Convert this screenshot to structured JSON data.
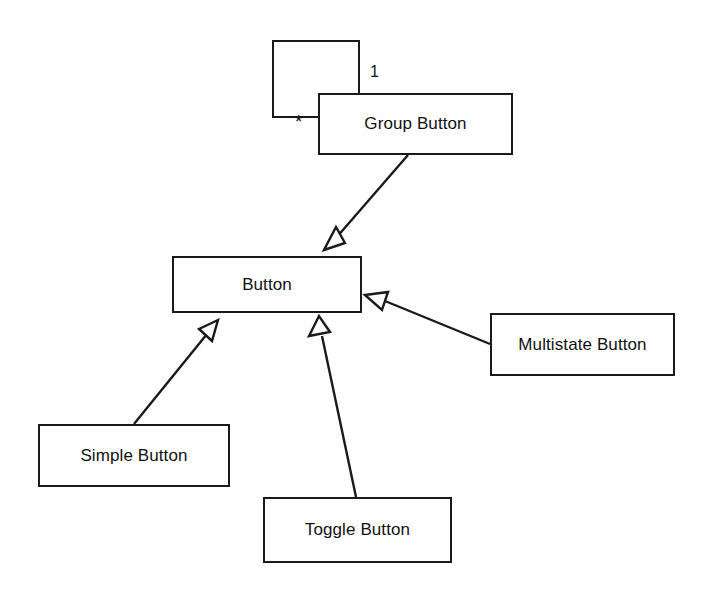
{
  "diagram": {
    "type": "uml-class-diagram",
    "background_color": "#ffffff",
    "stroke_color": "#1a1a1a",
    "text_color": "#121212",
    "classes": [
      {
        "id": "unnamed",
        "label": "",
        "x": 272,
        "y": 40,
        "w": 88,
        "h": 78
      },
      {
        "id": "group",
        "label": "Group Button",
        "x": 318,
        "y": 93,
        "w": 195,
        "h": 62
      },
      {
        "id": "button",
        "label": "Button",
        "x": 172,
        "y": 256,
        "w": 190,
        "h": 57
      },
      {
        "id": "simple",
        "label": "Simple Button",
        "x": 38,
        "y": 424,
        "w": 192,
        "h": 63
      },
      {
        "id": "toggle",
        "label": "Toggle Button",
        "x": 263,
        "y": 497,
        "w": 189,
        "h": 66
      },
      {
        "id": "multistate",
        "label": "Multistate Button",
        "x": 490,
        "y": 313,
        "w": 185,
        "h": 63
      }
    ],
    "multiplicities": [
      {
        "id": "one",
        "label": "1",
        "x": 370,
        "y": 64
      },
      {
        "id": "many",
        "label": "*",
        "x": 295,
        "y": 112
      }
    ],
    "generalizations": [
      {
        "id": "group-to-button",
        "from": "group",
        "to": "button",
        "arrow": "hollow-triangle"
      },
      {
        "id": "simple-to-button",
        "from": "simple",
        "to": "button",
        "arrow": "hollow-triangle"
      },
      {
        "id": "toggle-to-button",
        "from": "toggle",
        "to": "button",
        "arrow": "hollow-triangle"
      },
      {
        "id": "multistate-to-button",
        "from": "multistate",
        "to": "button",
        "arrow": "hollow-triangle"
      }
    ]
  }
}
